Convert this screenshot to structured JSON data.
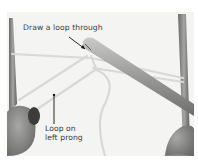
{
  "image": {
    "subject": "fork knitting / hairpin loop instruction photo",
    "background_color": "#f4f4f3"
  },
  "annotations": [
    {
      "id": "draw-loop",
      "text": "Draw a loop through"
    },
    {
      "id": "loop-left",
      "lines": [
        "Loop on",
        "left prong"
      ]
    }
  ]
}
